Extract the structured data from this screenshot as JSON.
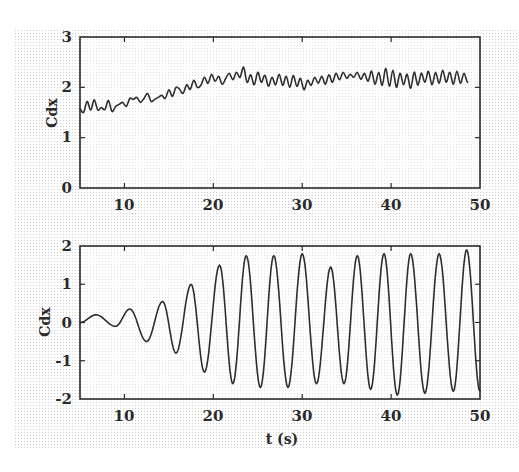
{
  "chart_data": [
    {
      "type": "line",
      "panel": "top",
      "title": "",
      "xlabel": "",
      "ylabel": "Cdx",
      "xlim": [
        5,
        50
      ],
      "ylim": [
        0,
        3
      ],
      "xticks": [
        10,
        20,
        30,
        40,
        50
      ],
      "yticks": [
        0,
        1,
        2,
        3
      ],
      "grid": false,
      "legend": null,
      "series": [
        {
          "name": "Cdx (mean drag, in-line)",
          "color": "#2e2e2e",
          "x": [
            5.0,
            5.4,
            5.8,
            6.2,
            6.6,
            7.0,
            7.4,
            7.8,
            8.2,
            8.6,
            9.0,
            9.4,
            9.8,
            10.2,
            10.6,
            11.0,
            11.4,
            11.8,
            12.2,
            12.6,
            13.0,
            13.4,
            13.8,
            14.2,
            14.6,
            15.0,
            15.4,
            15.8,
            16.2,
            16.6,
            17.0,
            17.4,
            17.8,
            18.2,
            18.6,
            19.0,
            19.4,
            19.8,
            20.2,
            20.6,
            21.0,
            21.4,
            21.8,
            22.2,
            22.6,
            23.0,
            23.4,
            23.8,
            24.2,
            24.6,
            25.0,
            25.4,
            25.8,
            26.2,
            26.6,
            27.0,
            27.4,
            27.8,
            28.2,
            28.6,
            29.0,
            29.4,
            29.8,
            30.2,
            30.6,
            31.0,
            31.4,
            31.8,
            32.2,
            32.6,
            33.0,
            33.4,
            33.8,
            34.2,
            34.6,
            35.0,
            35.4,
            35.8,
            36.2,
            36.6,
            37.0,
            37.4,
            37.8,
            38.2,
            38.6,
            39.0,
            39.4,
            39.8,
            40.2,
            40.6,
            41.0,
            41.4,
            41.8,
            42.2,
            42.6,
            43.0,
            43.4,
            43.8,
            44.2,
            44.6,
            45.0,
            45.4,
            45.8,
            46.2,
            46.6,
            47.0,
            47.4,
            47.8,
            48.2,
            48.6,
            49.0,
            49.4,
            49.8,
            50.0
          ],
          "values": [
            1.58,
            1.5,
            1.72,
            1.55,
            1.75,
            1.55,
            1.6,
            1.56,
            1.74,
            1.52,
            1.62,
            1.66,
            1.7,
            1.62,
            1.78,
            1.76,
            1.8,
            1.7,
            1.78,
            1.88,
            1.72,
            1.76,
            1.8,
            1.84,
            1.78,
            1.95,
            1.82,
            2.0,
            1.96,
            1.88,
            2.05,
            1.96,
            2.14,
            2.0,
            2.04,
            2.2,
            2.08,
            2.26,
            2.12,
            2.22,
            2.06,
            2.18,
            2.28,
            2.15,
            2.3,
            2.2,
            2.4,
            2.1,
            2.25,
            2.05,
            2.3,
            2.1,
            2.24,
            2.02,
            2.2,
            2.05,
            2.26,
            2.04,
            2.22,
            2.0,
            2.24,
            2.02,
            2.18,
            1.95,
            2.14,
            2.04,
            2.2,
            2.08,
            2.22,
            2.06,
            2.25,
            2.1,
            2.28,
            2.15,
            2.3,
            2.18,
            2.26,
            2.2,
            2.3,
            2.16,
            2.28,
            2.12,
            2.32,
            2.06,
            2.3,
            2.04,
            2.38,
            2.02,
            2.34,
            2.0,
            2.28,
            2.05,
            2.26,
            1.98,
            2.3,
            2.04,
            2.28,
            2.1,
            2.32,
            2.05,
            2.3,
            2.08,
            2.34,
            2.1,
            2.3,
            2.06,
            2.32,
            2.08,
            2.28,
            2.1,
            2.24
          ]
        }
      ]
    },
    {
      "type": "line",
      "panel": "bottom",
      "title": "",
      "xlabel": "t (s)",
      "ylabel": "Cdx",
      "xlim": [
        5,
        50
      ],
      "ylim": [
        -2,
        2
      ],
      "xticks": [
        10,
        20,
        30,
        40,
        50
      ],
      "yticks": [
        -2,
        -1,
        0,
        1,
        2
      ],
      "grid": false,
      "legend": null,
      "series": [
        {
          "name": "Cdx (oscillating component)",
          "color": "#2e2e2e",
          "extrema_t": [
            5.0,
            6.8,
            9.0,
            10.6,
            12.5,
            14.3,
            15.8,
            17.5,
            19.0,
            20.7,
            22.2,
            23.7,
            25.3,
            26.8,
            28.4,
            30.0,
            31.6,
            33.2,
            34.7,
            36.2,
            37.7,
            39.2,
            40.7,
            42.2,
            43.8,
            45.4,
            47.0,
            48.5,
            50.0
          ],
          "extrema_values": [
            0.0,
            0.2,
            -0.1,
            0.35,
            -0.5,
            0.55,
            -0.8,
            1.0,
            -1.3,
            1.5,
            -1.6,
            1.75,
            -1.7,
            1.75,
            -1.7,
            1.8,
            -1.6,
            1.45,
            -1.6,
            1.75,
            -1.75,
            1.8,
            -1.9,
            1.8,
            -1.85,
            1.8,
            -1.8,
            1.9,
            -1.8
          ]
        }
      ]
    }
  ],
  "panels": {
    "top": {
      "ylabel": "Cdx",
      "yticks": [
        "0",
        "1",
        "2",
        "3"
      ],
      "xticks": [
        "10",
        "20",
        "30",
        "40",
        "50"
      ]
    },
    "bottom": {
      "ylabel": "Cdx",
      "xlabel": "t (s)",
      "yticks": [
        "-2",
        "-1",
        "0",
        "1",
        "2"
      ],
      "xticks": [
        "10",
        "20",
        "30",
        "40",
        "50"
      ]
    }
  },
  "colors": {
    "ink": "#2a2a2a",
    "line": "#2e2e2e",
    "paper": "#ffffff",
    "halftone_dot": "#c8c8c8"
  }
}
